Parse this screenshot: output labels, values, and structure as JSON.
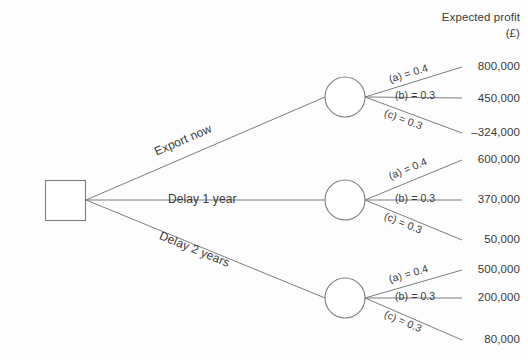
{
  "figure": {
    "type": "decision-tree",
    "header": {
      "line1": "Expected profit",
      "line2": "(£)"
    },
    "decision_node": {
      "shape": "square",
      "name": "decision-node"
    },
    "branches": [
      {
        "label": "Export now",
        "chance_node": "chance-node-export-now",
        "outcomes": [
          {
            "prob_label": "(a) = 0.4",
            "probability": 0.4,
            "payoff": "800,000",
            "payoff_value": 800000
          },
          {
            "prob_label": "(b) = 0.3",
            "probability": 0.3,
            "payoff": "450,000",
            "payoff_value": 450000
          },
          {
            "prob_label": "(c) = 0.3",
            "probability": 0.3,
            "payoff": "–324,000",
            "payoff_value": -324000
          }
        ]
      },
      {
        "label": "Delay 1 year",
        "chance_node": "chance-node-delay-1-year",
        "outcomes": [
          {
            "prob_label": "(a) = 0.4",
            "probability": 0.4,
            "payoff": "600,000",
            "payoff_value": 600000
          },
          {
            "prob_label": "(b) = 0.3",
            "probability": 0.3,
            "payoff": "370,000",
            "payoff_value": 370000
          },
          {
            "prob_label": "(c) = 0.3",
            "probability": 0.3,
            "payoff": "50,000",
            "payoff_value": 50000
          }
        ]
      },
      {
        "label": "Delay 2 years",
        "chance_node": "chance-node-delay-2-years",
        "outcomes": [
          {
            "prob_label": "(a) = 0.4",
            "probability": 0.4,
            "payoff": "500,000",
            "payoff_value": 500000
          },
          {
            "prob_label": "(b) = 0.3",
            "probability": 0.3,
            "payoff": "200,000",
            "payoff_value": 200000
          },
          {
            "prob_label": "(c) = 0.3",
            "probability": 0.3,
            "payoff": "80,000",
            "payoff_value": 80000
          }
        ]
      }
    ],
    "caption": "",
    "colors": {
      "line": "#7d7d7d",
      "text": "#3a3a3a",
      "background": "#fdfdfd"
    }
  }
}
